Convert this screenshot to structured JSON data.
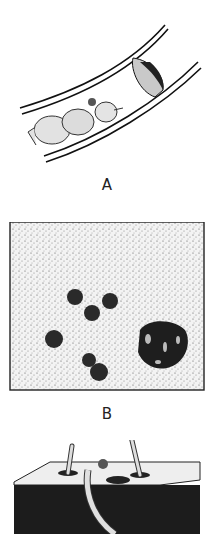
{
  "figure": {
    "panels": [
      {
        "id": "A",
        "label": "A",
        "description": "Larva inside a curved tube near a cup-shaped structure"
      },
      {
        "id": "B",
        "label": "B",
        "description": "Stippled field with dark round cells and a dark cluster"
      },
      {
        "id": "C",
        "label": "",
        "description": "Cut-away block with tubes/stems protruding from holes"
      }
    ]
  }
}
